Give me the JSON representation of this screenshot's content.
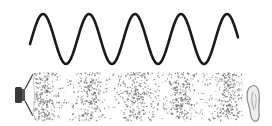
{
  "diagram": {
    "wave": {
      "type": "sine",
      "x_start": 30,
      "x_end": 238,
      "center_y": 39,
      "amplitude": 25,
      "period": 46,
      "cycles": 4.5,
      "stroke_color": "#1a1a1a"
    },
    "medium": {
      "x_start": 34,
      "x_end": 242,
      "y_top": 72,
      "y_bottom": 120,
      "particle_color": "#707070",
      "compressions_x": [
        43,
        87,
        132,
        178,
        226
      ],
      "rarefactions_x": [
        65,
        110,
        155,
        202
      ]
    },
    "source": {
      "icon": "speaker-icon",
      "x": 14,
      "y": 84,
      "color": "#3a3a3a"
    },
    "receiver": {
      "icon": "ear-icon",
      "x": 248,
      "y": 84,
      "color": "#9a9a9a"
    }
  }
}
